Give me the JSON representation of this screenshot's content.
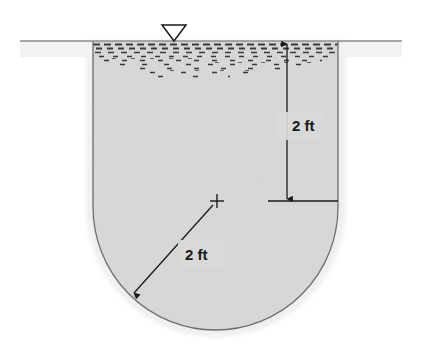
{
  "figure": {
    "kind": "engineering-cross-section",
    "background_color": "#ffffff"
  },
  "ground": {
    "surface_line_label": "ground-surface-line",
    "line_color": "#8c8c8c",
    "left_x": 20,
    "right_x": 402,
    "y": 41
  },
  "water": {
    "symbol_name": "water-table-triangle",
    "symbol_apex_x": 174,
    "symbol_apex_y": 41,
    "surface_y": 41,
    "hatch_color": "#3a3a3a",
    "hatch_rows": [
      {
        "y": 45,
        "density": 1.0
      },
      {
        "y": 50,
        "density": 0.95
      },
      {
        "y": 55,
        "density": 0.8
      },
      {
        "y": 60,
        "density": 0.55
      },
      {
        "y": 65,
        "density": 0.38
      },
      {
        "y": 70,
        "density": 0.22
      },
      {
        "y": 75,
        "density": 0.12
      }
    ]
  },
  "excavation": {
    "name": "excavation-cross-section",
    "left_wall_x": 93,
    "right_wall_x": 338,
    "top_y": 41,
    "straight_bottom_y": 207,
    "bottom_y": 330,
    "fill_color": "#d9d9d9",
    "halo_color": "#efefef",
    "outline_color": "#6e6e6e"
  },
  "dimensions": {
    "depth": {
      "name": "depth-dimension",
      "label": "2 ft",
      "value": 2,
      "unit": "ft",
      "orientation": "vertical",
      "x": 287,
      "from_y": 44,
      "to_y": 200,
      "label_x": 292,
      "label_y": 126,
      "extension_line": {
        "x1": 268,
        "x2": 338,
        "y": 201
      }
    },
    "radius": {
      "name": "radius-dimension",
      "label": "2 ft",
      "value": 2,
      "unit": "ft",
      "orientation": "diagonal",
      "center_x": 217,
      "center_y": 201,
      "arrow_x": 131,
      "arrow_y": 296,
      "label_x": 185,
      "label_y": 257,
      "center_mark": "plus-mark"
    }
  },
  "labels": {
    "depth_text": "2 ft",
    "radius_text": "2 ft"
  },
  "colors": {
    "soil_fill": "#d9d9d9",
    "halo": "#efefef",
    "outline": "#6e6e6e",
    "ground_line": "#8c8c8c",
    "ink": "#1a1a1a"
  }
}
